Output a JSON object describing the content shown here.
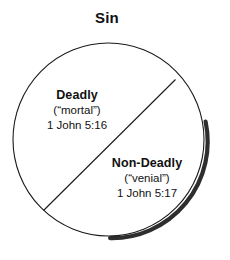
{
  "title": "Sin",
  "diagram": {
    "shape": "circle",
    "divider": "diagonal-chord",
    "outline_color": "#1a1a1a",
    "shadow_color": "#2b2b2b",
    "fill_color": "#ffffff",
    "background_color": "#ffffff"
  },
  "regions": [
    {
      "name": "deadly",
      "title": "Deadly",
      "alt_name": "(“mortal”)",
      "reference": "1 John 5:16"
    },
    {
      "name": "non-deadly",
      "title": "Non-Deadly",
      "alt_name": "(“venial”)",
      "reference": "1 John 5:17"
    }
  ]
}
